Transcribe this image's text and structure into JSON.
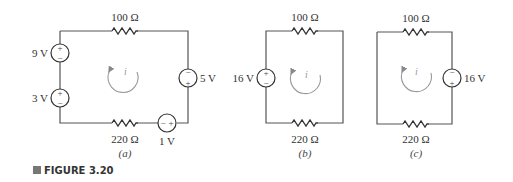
{
  "figure": {
    "label": "FIGURE 3.20",
    "marker_color": "#777777"
  },
  "circuits": [
    {
      "caption": "(a)",
      "top_resistor": "100 Ω",
      "bottom_resistor": "220 Ω",
      "current_label": "i",
      "sources": [
        {
          "label": "9 V",
          "position": "left-upper",
          "top_sign": "+",
          "bottom_sign": "−"
        },
        {
          "label": "3 V",
          "position": "left-lower",
          "top_sign": "+",
          "bottom_sign": "−"
        },
        {
          "label": "5 V",
          "position": "right",
          "top_sign": "−",
          "bottom_sign": "+"
        },
        {
          "label": "1 V",
          "position": "bottom",
          "left_sign": "−",
          "right_sign": "+"
        }
      ]
    },
    {
      "caption": "(b)",
      "top_resistor": "100 Ω",
      "bottom_resistor": "220 Ω",
      "current_label": "i",
      "sources": [
        {
          "label": "16 V",
          "position": "left",
          "top_sign": "+",
          "bottom_sign": "−"
        }
      ]
    },
    {
      "caption": "(c)",
      "top_resistor": "100 Ω",
      "bottom_resistor": "220 Ω",
      "current_label": "i",
      "sources": [
        {
          "label": "16 V",
          "position": "right",
          "top_sign": "−",
          "bottom_sign": "+"
        }
      ]
    }
  ]
}
